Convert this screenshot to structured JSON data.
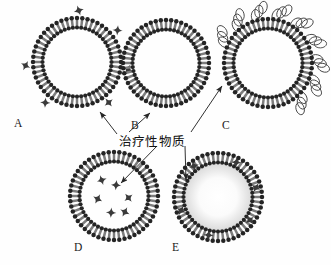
{
  "figure": {
    "background_color": "#ffffff",
    "ink_color": "#2b2b2b",
    "width": 331,
    "height": 265
  },
  "annotation": {
    "text": "治疗性物质",
    "meaning_label": "therapeutic-substance",
    "x": 119,
    "y": 138,
    "arrow_count": 5
  },
  "panels": [
    {
      "id": "A",
      "label": "A",
      "label_x": 14,
      "label_y": 118,
      "center_x": 77,
      "center_y": 62,
      "radius": 44,
      "drug_location": "surface-adsorbed",
      "drug_count": 6,
      "polymer_coat": false
    },
    {
      "id": "B",
      "label": "B",
      "label_x": 131,
      "label_y": 120,
      "center_x": 166,
      "center_y": 63,
      "radius": 43,
      "drug_location": "none",
      "drug_count": 0,
      "polymer_coat": false
    },
    {
      "id": "C",
      "label": "C",
      "label_x": 222,
      "label_y": 120,
      "center_x": 268,
      "center_y": 63,
      "radius": 44,
      "drug_location": "none",
      "drug_count": 0,
      "polymer_coat": true,
      "polymer_loop_count": 9
    },
    {
      "id": "D",
      "label": "D",
      "label_x": 74,
      "label_y": 242,
      "center_x": 114,
      "center_y": 196,
      "radius": 44,
      "drug_location": "aqueous-core",
      "drug_count": 6,
      "polymer_coat": false
    },
    {
      "id": "E",
      "label": "E",
      "label_x": 172,
      "label_y": 242,
      "center_x": 218,
      "center_y": 197,
      "radius": 44,
      "drug_location": "lipid-bilayer",
      "drug_count": 6,
      "polymer_coat": false,
      "core_shading": "#eeeeee"
    }
  ],
  "legend_items": [
    {
      "key": "drug-particle",
      "glyph": "four-pointed-star",
      "label": "治疗性物质"
    },
    {
      "key": "lipid",
      "glyph": "head-and-tail",
      "label": ""
    },
    {
      "key": "polymer",
      "glyph": "coiled-loop",
      "label": ""
    }
  ]
}
